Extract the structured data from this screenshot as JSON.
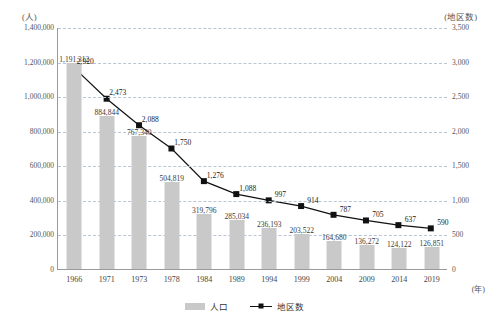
{
  "chart_data": {
    "type": "bar",
    "title": "",
    "subtitle": "",
    "xlabel": "(年)",
    "ylabel": "(人)",
    "y2label": "(地区数)",
    "grid": true,
    "legend_position": "bottom-center",
    "categories": [
      "1966",
      "1971",
      "1973",
      "1978",
      "1984",
      "1989",
      "1994",
      "1999",
      "2004",
      "2009",
      "2014",
      "2019"
    ],
    "ylim": [
      0,
      1400000
    ],
    "y2lim": [
      0,
      3500
    ],
    "yticks": [
      "0",
      "200,000",
      "400,000",
      "600,000",
      "800,000",
      "1,000,000",
      "1,200,000",
      "1,400,000"
    ],
    "ytick_values": [
      0,
      200000,
      400000,
      600000,
      800000,
      1000000,
      1200000,
      1400000
    ],
    "y2ticks": [
      "0",
      "500",
      "1,000",
      "1,500",
      "2,000",
      "2,500",
      "3,000",
      "3,500"
    ],
    "y2tick_values": [
      0,
      500,
      1000,
      1500,
      2000,
      2500,
      3000,
      3500
    ],
    "series": [
      {
        "name": "人口",
        "kind": "bar",
        "axis": "left",
        "color": "#c9c9c9",
        "values": [
          1191312,
          884844,
          767340,
          504819,
          319796,
          285034,
          236193,
          203522,
          164680,
          136272,
          124122,
          126851
        ],
        "labels": [
          "1,191,312",
          "884,844",
          "767,340",
          "504,819",
          "319,796",
          "285,034",
          "236,193",
          "203,522",
          "164,680",
          "136,272",
          "124,122",
          "126,851"
        ]
      },
      {
        "name": "地区数",
        "kind": "line",
        "axis": "right",
        "color": "#111111",
        "marker": "square",
        "values": [
          2920,
          2473,
          2088,
          1750,
          1276,
          1088,
          997,
          914,
          787,
          705,
          637,
          590
        ],
        "labels": [
          "2,920",
          "2,473",
          "2,088",
          "1,750",
          "1,276",
          "1,088",
          "997",
          "914",
          "787",
          "705",
          "637",
          "590"
        ]
      }
    ]
  },
  "legend": {
    "items": [
      {
        "label": "人口"
      },
      {
        "label": "地区数"
      }
    ]
  },
  "axes": {
    "left_unit": "(人)",
    "right_unit": "(地区数)",
    "x_unit": "(年)"
  }
}
